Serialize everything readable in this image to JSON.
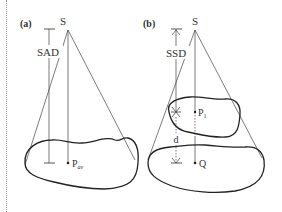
{
  "figure": {
    "panels": [
      {
        "id": "a",
        "label": "(a)",
        "source_label": "S",
        "distance_label": "SAD",
        "point_label": "P",
        "point_subscript": "av"
      },
      {
        "id": "b",
        "label": "(b)",
        "source_label": "S",
        "distance_label": "SSD",
        "inner_point_label": "P",
        "inner_point_subscript": "1",
        "depth_label": "d",
        "point_label": "Q"
      }
    ],
    "colors": {
      "line": "#333333",
      "outline": "#222222",
      "text": "#333333",
      "border": "#999999"
    }
  }
}
